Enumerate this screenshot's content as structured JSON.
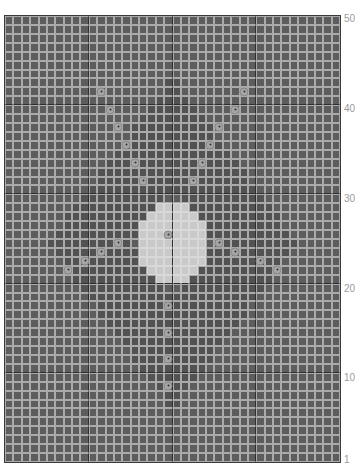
{
  "chart_grid": {
    "columns": 40,
    "rows": 50,
    "colors": {
      "cell": "#5d5d5d",
      "cell_dark": "#525252",
      "gap": "#aaaaaa",
      "light_cell": "#c9c9c9",
      "divider": "#2e2e2e",
      "dot": "#a5a5a5"
    },
    "divider_every": 10,
    "light_region": [
      {
        "row": 21,
        "from": 18,
        "to": 21
      },
      {
        "row": 22,
        "from": 17,
        "to": 22
      },
      {
        "row": 23,
        "from": 16,
        "to": 23
      },
      {
        "row": 24,
        "from": 16,
        "to": 23
      },
      {
        "row": 25,
        "from": 16,
        "to": 23
      },
      {
        "row": 26,
        "from": 16,
        "to": 23
      },
      {
        "row": 27,
        "from": 16,
        "to": 23
      },
      {
        "row": 28,
        "from": 17,
        "to": 22
      },
      {
        "row": 29,
        "from": 18,
        "to": 21
      }
    ],
    "dots": [
      {
        "col": 11,
        "row": 8
      },
      {
        "col": 12,
        "row": 10
      },
      {
        "col": 13,
        "row": 12
      },
      {
        "col": 14,
        "row": 14
      },
      {
        "col": 15,
        "row": 16
      },
      {
        "col": 16,
        "row": 18
      },
      {
        "col": 28,
        "row": 8
      },
      {
        "col": 27,
        "row": 10
      },
      {
        "col": 25,
        "row": 12
      },
      {
        "col": 24,
        "row": 14
      },
      {
        "col": 23,
        "row": 16
      },
      {
        "col": 22,
        "row": 18
      },
      {
        "col": 19,
        "row": 24
      },
      {
        "col": 13,
        "row": 25
      },
      {
        "col": 11,
        "row": 26
      },
      {
        "col": 9,
        "row": 27
      },
      {
        "col": 7,
        "row": 28
      },
      {
        "col": 25,
        "row": 25
      },
      {
        "col": 27,
        "row": 26
      },
      {
        "col": 30,
        "row": 27
      },
      {
        "col": 32,
        "row": 28
      },
      {
        "col": 19,
        "row": 32
      },
      {
        "col": 19,
        "row": 35
      },
      {
        "col": 19,
        "row": 38
      },
      {
        "col": 19,
        "row": 41
      }
    ]
  },
  "row_labels": [
    {
      "text": "50",
      "top": 14
    },
    {
      "text": "40",
      "top": 104
    },
    {
      "text": "30",
      "top": 194
    },
    {
      "text": "20",
      "top": 284
    },
    {
      "text": "10",
      "top": 373
    },
    {
      "text": "1",
      "top": 455
    }
  ]
}
